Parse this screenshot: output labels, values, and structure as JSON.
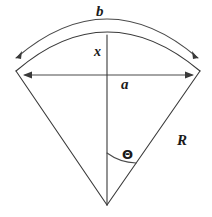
{
  "diagram": {
    "background_color": "#ffffff",
    "line_color": "#3a3a3a",
    "labels": {
      "arc_outer": "b",
      "height_segment": "x",
      "chord": "a",
      "radius": "R",
      "angle": "Θ"
    },
    "geometry": {
      "apex": [
        107,
        205
      ],
      "left_vertex": [
        16,
        71
      ],
      "right_vertex": [
        200,
        71
      ],
      "chord_y": 75,
      "chord_left_x": 25,
      "chord_right_x": 192,
      "inner_arc_apex_y": 35,
      "outer_arc_apex_y": 22,
      "vertical_line_top_y": 35,
      "angle_arc_radius": 52
    },
    "elements": [
      "outer-arc-b",
      "inner-arc",
      "chord-a",
      "vertical-x-line",
      "left-radius",
      "right-radius",
      "angle-arc"
    ]
  }
}
